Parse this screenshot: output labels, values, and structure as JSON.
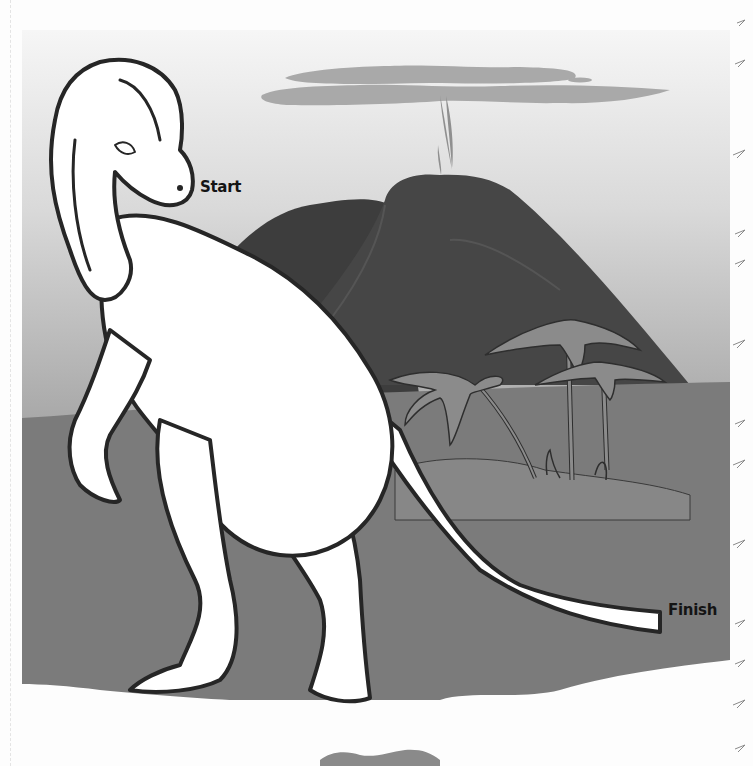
{
  "worksheet": {
    "type": "maze-illustration",
    "labels": {
      "start": "Start",
      "finish": "Finish"
    },
    "scene": {
      "subject": "hadrosaur dinosaur (standing, looking back)",
      "background_elements": [
        "volcano",
        "smoke plume",
        "clouds",
        "palm trees",
        "hill"
      ],
      "border_decoration": "fern fronds along right edge",
      "footer_decoration": "small lizard/dinosaur silhouette at bottom center"
    },
    "colors": {
      "sky_top": "#f4f4f4",
      "sky_bottom": "#a8a8a8",
      "ground": "#7c7c7c",
      "hill": "#8a8a8a",
      "volcano_dark": "#3e3e3e",
      "volcano": "#474747",
      "palms": "#8c8c8c",
      "cloud": "#a9a9a9",
      "outline": "#262626",
      "dino_fill": "#ffffff",
      "page": "#fdfdfd"
    }
  }
}
